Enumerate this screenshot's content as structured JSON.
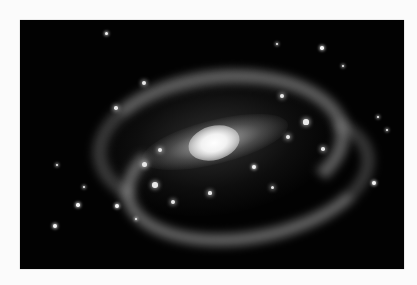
{
  "image": {
    "subject": "barred spiral galaxy",
    "style": "grayscale astronomical photograph",
    "background_color": "#020202",
    "page_color": "#fbfbfb"
  },
  "caption": {
    "text": "",
    "note": "caption text at top edge is cut off; only descenders visible"
  },
  "stars": [
    {
      "x": 86,
      "y": 13,
      "r": 1.5
    },
    {
      "x": 257,
      "y": 24,
      "r": 1.2
    },
    {
      "x": 302,
      "y": 28,
      "r": 1.8
    },
    {
      "x": 323,
      "y": 46,
      "r": 1.3
    },
    {
      "x": 358,
      "y": 97,
      "r": 1.2
    },
    {
      "x": 354,
      "y": 163,
      "r": 2.3
    },
    {
      "x": 35,
      "y": 206,
      "r": 2.3
    },
    {
      "x": 58,
      "y": 185,
      "r": 1.7
    },
    {
      "x": 97,
      "y": 186,
      "r": 2.0
    },
    {
      "x": 116,
      "y": 199,
      "r": 1.2
    },
    {
      "x": 234,
      "y": 147,
      "r": 2.0
    },
    {
      "x": 37,
      "y": 145,
      "r": 1.4
    },
    {
      "x": 64,
      "y": 167,
      "r": 1.1
    },
    {
      "x": 367,
      "y": 110,
      "r": 1.0
    }
  ],
  "knots": [
    {
      "x": 124,
      "y": 63,
      "r": 2.2
    },
    {
      "x": 96,
      "y": 88,
      "r": 1.8
    },
    {
      "x": 262,
      "y": 76,
      "r": 2.0
    },
    {
      "x": 286,
      "y": 102,
      "r": 2.6
    },
    {
      "x": 268,
      "y": 117,
      "r": 2.0
    },
    {
      "x": 124,
      "y": 144,
      "r": 2.5
    },
    {
      "x": 135,
      "y": 165,
      "r": 2.8
    },
    {
      "x": 153,
      "y": 182,
      "r": 2.3
    },
    {
      "x": 190,
      "y": 173,
      "r": 1.6
    },
    {
      "x": 303,
      "y": 129,
      "r": 1.8
    },
    {
      "x": 252,
      "y": 167,
      "r": 1.5
    },
    {
      "x": 140,
      "y": 130,
      "r": 2.0
    }
  ]
}
